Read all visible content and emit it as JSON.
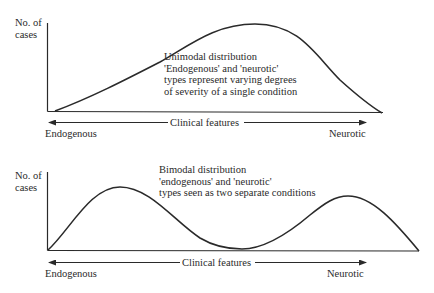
{
  "top_panel": {
    "y_label_line1": "No. of",
    "y_label_line2": "cases",
    "description": [
      "Unimodal distribution",
      "'Endogenous' and 'neurotic'",
      "types represent varying degrees",
      "of severity of a single condition"
    ],
    "x_axis_label": "Clinical features",
    "left_end_label": "Endogenous",
    "right_end_label": "Neurotic"
  },
  "bottom_panel": {
    "y_label_line1": "No. of",
    "y_label_line2": "cases",
    "description": [
      "Bimodal distribution",
      "'endogenous' and 'neurotic'",
      "types seen as two separate conditions"
    ],
    "x_axis_label": "Clinical features",
    "left_end_label": "Endogenous",
    "right_end_label": "Neurotic"
  },
  "colors": {
    "ink": "#2a2a2a",
    "background": "#ffffff"
  }
}
